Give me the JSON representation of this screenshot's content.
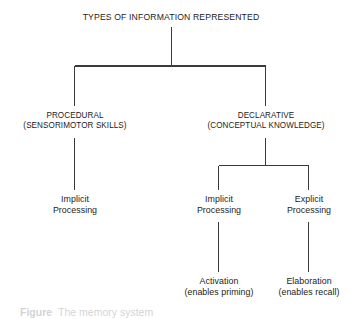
{
  "figure": {
    "title": "TYPES OF INFORMATION REPRESENTED",
    "orientation": "top-down tree",
    "line_color": "#3a3a3a",
    "background_color": "#ffffff",
    "text_color": "#1c1c1c"
  },
  "nodes": {
    "root": {
      "label": "TYPES OF INFORMATION REPRESENTED",
      "line1": "TYPES OF INFORMATION REPRESENTED"
    },
    "procedural": {
      "line1": "PROCEDURAL",
      "line2": "(SENSORIMOTOR SKILLS)"
    },
    "declarative": {
      "line1": "DECLARATIVE",
      "line2": "(CONCEPTUAL KNOWLEDGE)"
    },
    "procedural_implicit": {
      "line1": "Implicit",
      "line2": "Processing"
    },
    "declarative_implicit": {
      "line1": "Implicit",
      "line2": "Processing"
    },
    "declarative_explicit": {
      "line1": "Explicit",
      "line2": "Processing"
    },
    "activation": {
      "line1": "Activation",
      "line2": "(enables priming)"
    },
    "elaboration": {
      "line1": "Elaboration",
      "line2": "(enables recall)"
    }
  },
  "caption": {
    "label": "Figure",
    "text": "The memory system"
  }
}
